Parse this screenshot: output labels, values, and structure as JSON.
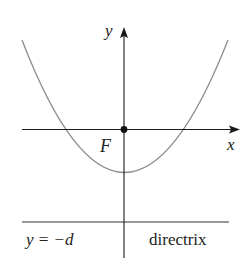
{
  "diagram": {
    "type": "parabola-focus-directrix",
    "axes": {
      "x_label": "x",
      "y_label": "y"
    },
    "focus": {
      "label": "F"
    },
    "directrix": {
      "equation": "y = −d",
      "label": "directrix"
    },
    "colors": {
      "axes": "#1a1a1a",
      "parabola": "#8c8c8c",
      "directrix": "#333333",
      "focus": "#111111"
    }
  }
}
